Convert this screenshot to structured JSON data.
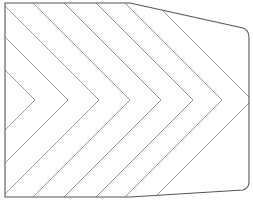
{
  "diagram": {
    "colors": {
      "background": "#ffffff",
      "outline": "#555555",
      "hatch": "#9a9a9a"
    },
    "outline": {
      "points": [
        [
          5,
          3
        ],
        [
          130,
          3
        ],
        [
          243,
          28
        ],
        [
          249,
          38
        ],
        [
          249,
          182
        ],
        [
          243,
          190
        ],
        [
          130,
          197
        ],
        [
          5,
          197
        ]
      ]
    },
    "chevrons": {
      "apex_y": 100,
      "apex_x": [
        35,
        68,
        99,
        130,
        161,
        193,
        222,
        252
      ]
    }
  }
}
